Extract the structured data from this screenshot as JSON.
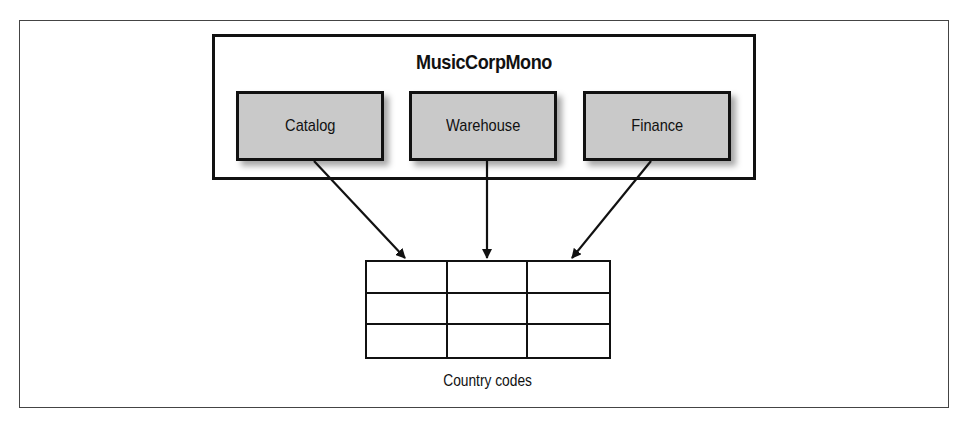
{
  "diagram": {
    "monolith": {
      "title": "MusicCorpMono",
      "modules": [
        {
          "label": "Catalog"
        },
        {
          "label": "Warehouse"
        },
        {
          "label": "Finance"
        }
      ]
    },
    "shared_table": {
      "label": "Country codes",
      "rows": 3,
      "columns": 3
    },
    "edges": [
      {
        "from": "Catalog",
        "to": "Country codes"
      },
      {
        "from": "Warehouse",
        "to": "Country codes"
      },
      {
        "from": "Finance",
        "to": "Country codes"
      }
    ],
    "colors": {
      "module_fill": "#c9c9c9",
      "stroke": "#111111",
      "background": "#ffffff"
    }
  }
}
